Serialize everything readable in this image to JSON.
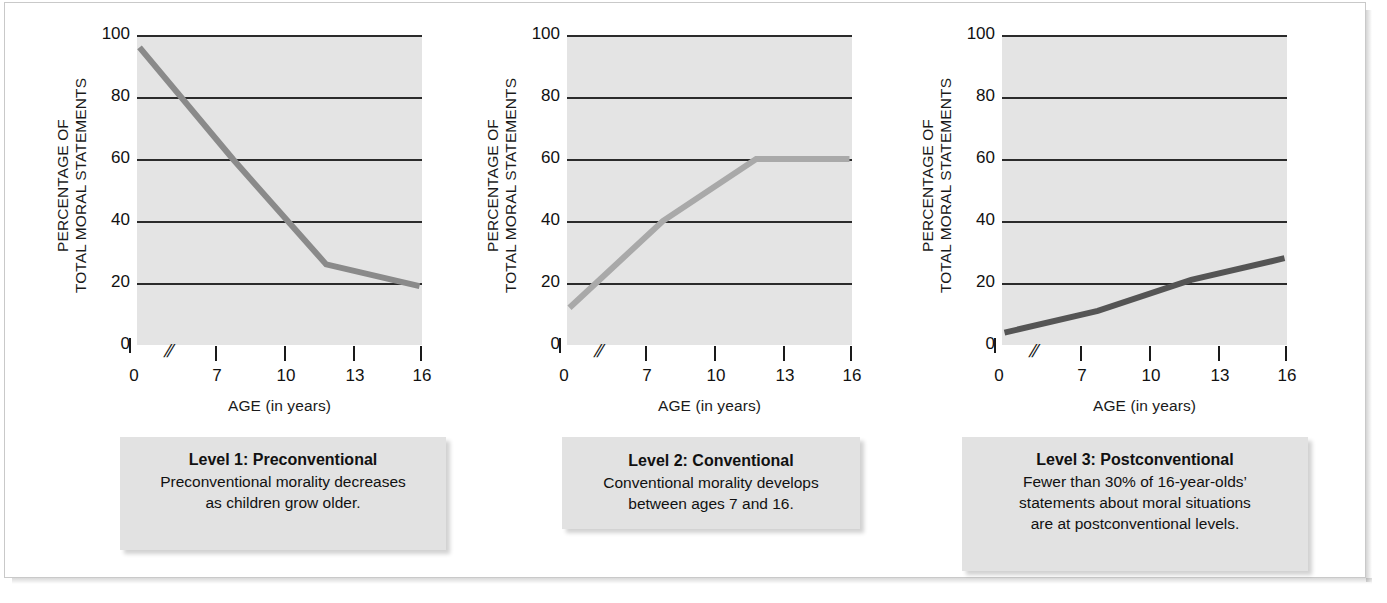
{
  "figure": {
    "background": "#ffffff",
    "frame_border_color": "#c9c9c9"
  },
  "common": {
    "y_axis_title": "PERCENTAGE OF\nTOTAL MORAL STATEMENTS",
    "x_axis_title": "AGE (in years)",
    "y_tick_labels": [
      "100",
      "80",
      "60",
      "40",
      "20",
      "0"
    ],
    "x_tick_labels": [
      "0",
      "7",
      "10",
      "13",
      "16"
    ],
    "axis_break_symbol": "//",
    "plot_background": "#e4e4e4",
    "gridline_color": "#2b2b2b"
  },
  "panels": [
    {
      "id": "panel-1",
      "line_color": "#8a8a8a",
      "caption": {
        "title": "Level 1: Preconventional",
        "body": "Preconventional morality decreases\nas children grow older."
      }
    },
    {
      "id": "panel-2",
      "line_color": "#a9a9a9",
      "caption": {
        "title": "Level 2: Conventional",
        "body": "Conventional morality develops\nbetween ages 7 and 16."
      }
    },
    {
      "id": "panel-3",
      "line_color": "#555555",
      "caption": {
        "title": "Level 3: Postconventional",
        "body": "Fewer than 30% of 16-year-olds’\nstatements about moral situations\nare at postconventional levels."
      }
    }
  ],
  "chart_data": [
    {
      "type": "line",
      "title": "Level 1: Preconventional",
      "xlabel": "AGE (in years)",
      "ylabel": "PERCENTAGE OF TOTAL MORAL STATEMENTS",
      "x": [
        7,
        10,
        13,
        16
      ],
      "values": [
        96,
        60,
        26,
        19
      ],
      "xlim": [
        7,
        16
      ],
      "ylim": [
        0,
        100
      ],
      "xticks": [
        0,
        7,
        10,
        13,
        16
      ],
      "yticks": [
        0,
        20,
        40,
        60,
        80,
        100
      ],
      "grid": "horizontal",
      "legend": "none",
      "axis_break": true,
      "line_color": "#8a8a8a"
    },
    {
      "type": "line",
      "title": "Level 2: Conventional",
      "xlabel": "AGE (in years)",
      "ylabel": "PERCENTAGE OF TOTAL MORAL STATEMENTS",
      "x": [
        7,
        10,
        13,
        16
      ],
      "values": [
        12,
        40,
        60,
        60
      ],
      "xlim": [
        7,
        16
      ],
      "ylim": [
        0,
        100
      ],
      "xticks": [
        0,
        7,
        10,
        13,
        16
      ],
      "yticks": [
        0,
        20,
        40,
        60,
        80,
        100
      ],
      "grid": "horizontal",
      "legend": "none",
      "axis_break": true,
      "line_color": "#a9a9a9"
    },
    {
      "type": "line",
      "title": "Level 3: Postconventional",
      "xlabel": "AGE (in years)",
      "ylabel": "PERCENTAGE OF TOTAL MORAL STATEMENTS",
      "x": [
        7,
        10,
        13,
        16
      ],
      "values": [
        4,
        11,
        21,
        28
      ],
      "xlim": [
        7,
        16
      ],
      "ylim": [
        0,
        100
      ],
      "xticks": [
        0,
        7,
        10,
        13,
        16
      ],
      "yticks": [
        0,
        20,
        40,
        60,
        80,
        100
      ],
      "grid": "horizontal",
      "legend": "none",
      "axis_break": true,
      "line_color": "#555555"
    }
  ]
}
